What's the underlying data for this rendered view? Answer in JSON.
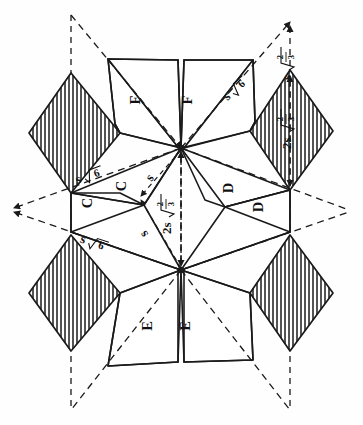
{
  "figure": {
    "background_color": "#ffffff",
    "line_color": "#1a1a1a",
    "hatch_color": "#1a1a1a"
  },
  "face_labels": [
    {
      "id": "f-top-left",
      "text": "F",
      "x": 140,
      "y": 100
    },
    {
      "id": "f-top-right",
      "text": "F",
      "x": 192,
      "y": 100
    },
    {
      "id": "c-upper",
      "text": "C",
      "x": 126,
      "y": 186
    },
    {
      "id": "c-lower",
      "text": "C",
      "x": 92,
      "y": 203
    },
    {
      "id": "d-upper",
      "text": "D",
      "x": 233,
      "y": 188
    },
    {
      "id": "d-lower",
      "text": "D",
      "x": 263,
      "y": 207
    },
    {
      "id": "e-bottom-left",
      "text": "E",
      "x": 152,
      "y": 326
    },
    {
      "id": "e-bottom-right",
      "text": "E",
      "x": 190,
      "y": 326
    }
  ],
  "dimension_labels": [
    {
      "id": "len-top-right-outer",
      "kind": "radical-fraction",
      "coefficient": "s",
      "numerator": "2",
      "denominator": "3",
      "x": 287,
      "y": 58,
      "note": "s times square root of two thirds"
    },
    {
      "id": "len-right-diamond",
      "kind": "radical-fraction",
      "coefficient": "2s",
      "numerator": "2",
      "denominator": "3",
      "x": 287,
      "y": 122,
      "note": "2s times square root of two thirds"
    },
    {
      "id": "len-center-vertical",
      "kind": "radical-fraction",
      "coefficient": "2s",
      "numerator": "2",
      "denominator": "3",
      "x": 167,
      "y": 207,
      "note": "2s times square root of two thirds"
    },
    {
      "id": "len-upper-right-diag",
      "kind": "radical",
      "coefficient": "s",
      "radicand": "6",
      "x": 236,
      "y": 88,
      "note": "s times square root of six"
    },
    {
      "id": "len-upper-left-diag",
      "kind": "radical",
      "coefficient": "s",
      "radicand": "6",
      "x": 90,
      "y": 175,
      "note": "s times square root of six"
    },
    {
      "id": "len-lower-left-diag",
      "kind": "radical",
      "coefficient": "s",
      "radicand": "6",
      "x": 95,
      "y": 243,
      "note": "s times square root of six"
    },
    {
      "id": "len-s-upper",
      "kind": "plain",
      "text": "s",
      "x": 153,
      "y": 180,
      "note": "edge length s"
    },
    {
      "id": "len-s-lower",
      "kind": "plain",
      "text": "s",
      "x": 147,
      "y": 232,
      "note": "edge length s"
    }
  ],
  "legend": {
    "symbol_s": "s",
    "radical_sign": "√",
    "hatch_style": "vertical-lines"
  }
}
